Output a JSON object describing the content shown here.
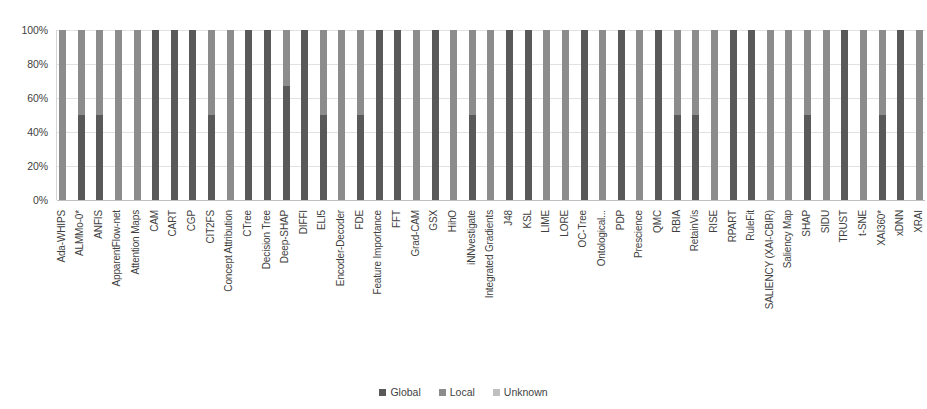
{
  "chart_data": {
    "type": "bar",
    "subtype": "stacked-percentage",
    "title": "",
    "xlabel": "",
    "ylabel": "",
    "ylim": [
      0,
      100
    ],
    "grid": true,
    "legend_position": "bottom",
    "y_ticks": [
      "0%",
      "20%",
      "40%",
      "60%",
      "80%",
      "100%"
    ],
    "categories": [
      "Ada-WHIPS",
      "ALMMo-0*",
      "ANFIS",
      "ApparentFlow-net",
      "Attention Maps",
      "CAM",
      "CART",
      "CGP",
      "CIT2FS",
      "Concept Attribution",
      "CTree",
      "Decision Tree",
      "Deep-SHAP",
      "DIFFI",
      "ELI5",
      "Encoder-Decoder",
      "FDE",
      "Feature Importance",
      "FFT",
      "Grad-CAM",
      "GSX",
      "HihO",
      "iNNvestigate",
      "Integrated Gradients",
      "J48",
      "KSL",
      "LIME",
      "LORE",
      "OC-Tree",
      "Ontological...",
      "PDP",
      "Prescience",
      "QMC",
      "RBIA",
      "RetainVis",
      "RISE",
      "RPART",
      "RuleFit",
      "SALIENCY (XAI-CBIR)",
      "Saliency Map",
      "SHAP",
      "SIDU",
      "TRUST",
      "t-SNE",
      "XAI360*",
      "xDNN",
      "XRAI"
    ],
    "series": [
      {
        "name": "Global",
        "color": "#595959",
        "values": [
          0,
          50,
          50,
          0,
          0,
          100,
          100,
          100,
          50,
          0,
          100,
          100,
          67,
          100,
          50,
          0,
          50,
          100,
          100,
          0,
          100,
          0,
          50,
          0,
          100,
          100,
          0,
          0,
          100,
          0,
          100,
          0,
          100,
          50,
          50,
          0,
          100,
          100,
          0,
          0,
          50,
          0,
          100,
          0,
          50,
          100,
          0
        ]
      },
      {
        "name": "Local",
        "color": "#8c8c8c",
        "values": [
          100,
          50,
          50,
          100,
          100,
          0,
          0,
          0,
          50,
          100,
          0,
          0,
          33,
          0,
          50,
          100,
          50,
          0,
          0,
          100,
          0,
          100,
          50,
          100,
          0,
          0,
          100,
          100,
          0,
          100,
          0,
          100,
          0,
          50,
          50,
          100,
          0,
          0,
          100,
          100,
          50,
          100,
          0,
          100,
          50,
          0,
          100
        ]
      },
      {
        "name": "Unknown",
        "color": "#bfbfbf",
        "values": [
          0,
          0,
          0,
          0,
          0,
          0,
          0,
          0,
          0,
          0,
          0,
          0,
          0,
          0,
          0,
          0,
          0,
          0,
          0,
          0,
          0,
          0,
          0,
          0,
          0,
          0,
          0,
          0,
          0,
          0,
          0,
          0,
          0,
          0,
          0,
          0,
          0,
          0,
          0,
          0,
          0,
          0,
          0,
          0,
          0,
          0,
          0
        ]
      }
    ]
  },
  "legend": {
    "items": [
      {
        "label": "Global",
        "color": "#595959"
      },
      {
        "label": "Local",
        "color": "#8c8c8c"
      },
      {
        "label": "Unknown",
        "color": "#bfbfbf"
      }
    ]
  }
}
